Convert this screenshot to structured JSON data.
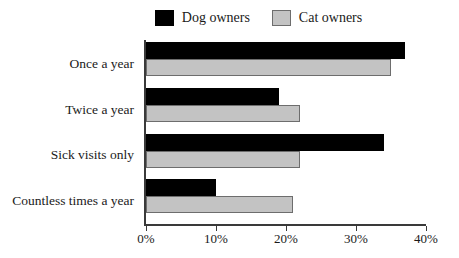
{
  "chart_data": {
    "type": "bar",
    "orientation": "horizontal",
    "title": "",
    "xlabel": "",
    "ylabel": "",
    "xlim": [
      0,
      40
    ],
    "grid": false,
    "legend_position": "top-center",
    "categories": [
      "Once a year",
      "Twice a year",
      "Sick visits only",
      "Countless times a year"
    ],
    "series": [
      {
        "name": "Dog owners",
        "color": "#000000",
        "values": [
          37,
          19,
          34,
          10
        ]
      },
      {
        "name": "Cat owners",
        "color": "#c3c3c3",
        "values": [
          35,
          22,
          22,
          21
        ]
      }
    ],
    "xticks": [
      {
        "value": 0,
        "label": "0%"
      },
      {
        "value": 10,
        "label": "10%"
      },
      {
        "value": 20,
        "label": "20%"
      },
      {
        "value": 30,
        "label": "30%"
      },
      {
        "value": 40,
        "label": "40%"
      }
    ]
  },
  "legend": {
    "entries": [
      {
        "label": "Dog owners",
        "swatch": "black-swatch"
      },
      {
        "label": "Cat owners",
        "swatch": "gray-swatch"
      }
    ]
  },
  "colors": {
    "dog": "#000000",
    "cat": "#c3c3c3",
    "cat_border": "#6d6d6d",
    "axis": "#3a3a3a",
    "background": "#ffffff",
    "text": "#1a1a1a"
  }
}
